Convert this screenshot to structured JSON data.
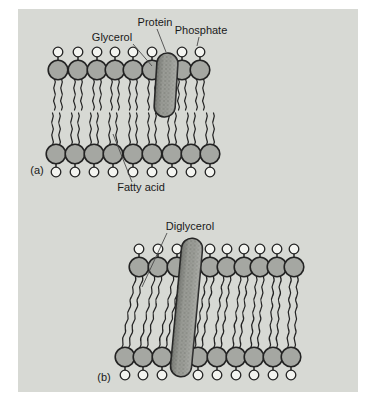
{
  "labels": {
    "glycerol": "Glycerol",
    "protein": "Protein",
    "phosphate": "Phosphate",
    "fatty_acid": "Fatty acid",
    "diglycerol": "Diglycerol",
    "panel_a": "(a)",
    "panel_b": "(b)"
  },
  "figure": {
    "colors": {
      "page_bg": "#ffffff",
      "panel_bg": "#d7d9d4",
      "head_fill": "#a5a7a2",
      "phosphate_fill": "#f3f4f0",
      "protein_fill": "#9b9d97",
      "protein_speckle": "#6e706a",
      "outline": "#232323",
      "label_color": "#1a1a1a"
    },
    "membrane_a": {
      "top_head_xs": [
        58,
        78,
        97,
        115,
        133,
        152,
        182,
        200
      ],
      "bottom_head_xs": [
        56,
        75,
        94,
        113,
        133,
        152,
        172,
        191,
        210
      ],
      "head_r": 9.8,
      "phos_r": 4.8,
      "top_head_cy": 70,
      "top_phos_cy": 52,
      "top_tail_y": [
        79,
        110
      ],
      "bottom_head_cy": 154,
      "bottom_phos_cy": 172,
      "bottom_tail_y": [
        113,
        145
      ],
      "protein": {
        "x_top": 168,
        "y_top": 53,
        "x_bottom": 164,
        "y_bottom": 117,
        "width": 21
      }
    },
    "membrane_b": {
      "top_head_xs": [
        139,
        158,
        177,
        210,
        227,
        244,
        260,
        277,
        294
      ],
      "bottom_head_xs": [
        125,
        143,
        162,
        198,
        217,
        236,
        254,
        273,
        291
      ],
      "head_r": 9.8,
      "phos_r": 4.8,
      "top_head_cy": 267,
      "top_phos_cy": 249,
      "bottom_head_cy": 357,
      "bottom_phos_cy": 375,
      "tail_y": [
        277,
        348
      ],
      "protein": {
        "x_top": 193,
        "y_top": 238,
        "x_bottom": 180,
        "y_bottom": 377,
        "width": 21
      }
    }
  }
}
